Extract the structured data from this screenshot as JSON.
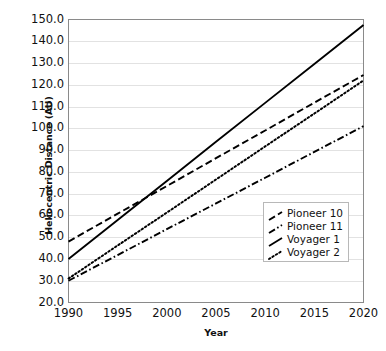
{
  "chart_data": {
    "type": "line",
    "title": "",
    "xlabel": "Year",
    "ylabel": "Heliocentric Distance (AU)",
    "xlim": [
      1990,
      2020
    ],
    "ylim": [
      20.0,
      150.0
    ],
    "x_ticks": [
      1990,
      1995,
      2000,
      2005,
      2010,
      2015,
      2020
    ],
    "x_tick_labels": [
      "1990",
      "1995",
      "2000",
      "2005",
      "2010",
      "2015",
      "2020"
    ],
    "y_ticks": [
      20.0,
      30.0,
      40.0,
      50.0,
      60.0,
      70.0,
      80.0,
      90.0,
      100.0,
      110.0,
      120.0,
      130.0,
      140.0,
      150.0
    ],
    "y_tick_labels": [
      "20.0",
      "30.0",
      "40.0",
      "50.0",
      "60.0",
      "70.0",
      "80.0",
      "90.0",
      "100.0",
      "110.0",
      "120.0",
      "130.0",
      "140.0",
      "150.0"
    ],
    "grid": "horizontal",
    "grid_color": "#e2e2e2",
    "legend_position": "lower right",
    "x": [
      1990,
      1995,
      2000,
      2005,
      2010,
      2015,
      2020
    ],
    "series": [
      {
        "name": "Pioneer 10",
        "style": "dashed",
        "color": "#000000",
        "values": [
          48.0,
          60.8,
          73.5,
          86.3,
          99.0,
          111.8,
          124.5
        ]
      },
      {
        "name": "Pioneer 11",
        "style": "dashdot",
        "color": "#000000",
        "values": [
          30.0,
          41.8,
          53.7,
          65.5,
          77.3,
          89.2,
          101.0
        ]
      },
      {
        "name": "Voyager 1",
        "style": "solid",
        "color": "#000000",
        "values": [
          40.0,
          57.9,
          75.8,
          93.8,
          111.7,
          129.6,
          147.5
        ]
      },
      {
        "name": "Voyager 2",
        "style": "dotted",
        "color": "#000000",
        "values": [
          31.0,
          46.2,
          61.3,
          76.5,
          91.7,
          106.8,
          122.0
        ]
      }
    ]
  },
  "legend": {
    "entries": [
      {
        "label": "Pioneer 10"
      },
      {
        "label": "Pioneer 11"
      },
      {
        "label": "Voyager 1"
      },
      {
        "label": "Voyager 2"
      }
    ]
  }
}
